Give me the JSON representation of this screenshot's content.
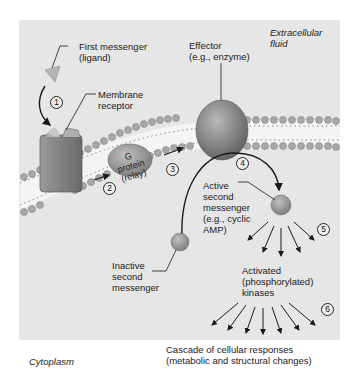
{
  "diagram": {
    "regions": {
      "extracellular": "Extracellular\nfluid",
      "cytoplasm": "Cytoplasm"
    },
    "labels": {
      "first_messenger": "First messenger\n(ligand)",
      "membrane_receptor": "Membrane\nreceptor",
      "effector": "Effector\n(e.g., enzyme)",
      "g_protein": "G protein\n(relay)",
      "active_second_messenger": "Active\nsecond\nmessenger\n(e.g., cyclic\nAMP)",
      "inactive_second_messenger": "Inactive\nsecond\nmessenger",
      "kinases": "Activated\n(phosphorylated)\nkinases",
      "cascade": "Cascade of cellular responses\n(metabolic and structural changes)"
    },
    "steps": [
      "1",
      "2",
      "3",
      "4",
      "5",
      "6"
    ],
    "colors": {
      "background": "#e6e6e6",
      "membrane_head": "#a8a8a8",
      "receptor": "#7d7d7d",
      "effector": "#8a8a8a",
      "g_protein": "#9a9a9a",
      "ligand": "#b5b5b5",
      "arrow": "#1a1a1a"
    }
  }
}
